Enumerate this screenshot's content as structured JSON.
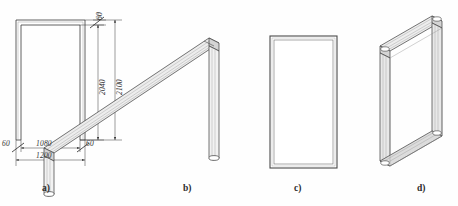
{
  "drawing": {
    "title": "Door frame construction variants",
    "background_color": "#fefefe",
    "line_color": "#3a3a3a",
    "shade_color": "#b8b8b8",
    "figures": [
      {
        "id": "a",
        "caption": "a)",
        "view": "flat-elevation",
        "shape": "u-frame-open-bottom",
        "description": "Flat elevation of three-sided door frame with dimensions"
      },
      {
        "id": "b",
        "caption": "b)",
        "view": "isometric",
        "shape": "u-frame-open-bottom",
        "description": "Isometric view of three-sided door frame profile"
      },
      {
        "id": "c",
        "caption": "c)",
        "view": "flat-elevation",
        "shape": "closed-rectangular-frame",
        "description": "Flat elevation of four-sided closed door frame"
      },
      {
        "id": "d",
        "caption": "d)",
        "view": "isometric",
        "shape": "closed-rectangular-frame",
        "description": "Isometric view of four-sided closed door frame profile"
      }
    ],
    "dimensions": {
      "top_jamb_thickness": "60",
      "clear_height": "2040",
      "overall_height": "2100",
      "left_jamb_thickness": "60",
      "clear_width": "1080",
      "right_jamb_thickness": "60",
      "overall_width": "1200"
    }
  }
}
